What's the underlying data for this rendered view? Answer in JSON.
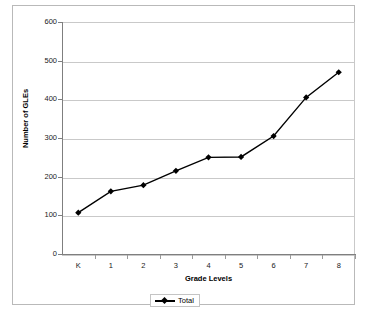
{
  "chart_data": {
    "type": "line",
    "title": "",
    "xlabel": "Grade Levels",
    "ylabel": "Number of GLEs",
    "categories": [
      "K",
      "1",
      "2",
      "3",
      "4",
      "5",
      "6",
      "7",
      "8"
    ],
    "series": [
      {
        "name": "Total",
        "values": [
          107,
          162,
          178,
          215,
          250,
          251,
          305,
          405,
          470
        ],
        "color": "#000000",
        "marker": "diamond"
      }
    ],
    "ylim": [
      0,
      600
    ],
    "y_ticks": [
      0,
      100,
      200,
      300,
      400,
      500,
      600
    ],
    "y_tick_labels": [
      "0",
      "100",
      "200",
      "300",
      "400",
      "500",
      "600"
    ],
    "grid": "horizontal",
    "legend_position": "bottom",
    "legend_entries": [
      "Total"
    ],
    "gridline_color": "#c9c9c9",
    "axis_color": "#7f7f7f",
    "frame_color": "#b9b9b9",
    "background_color": "#ffffff"
  },
  "legend": {
    "total_label": "Total"
  }
}
